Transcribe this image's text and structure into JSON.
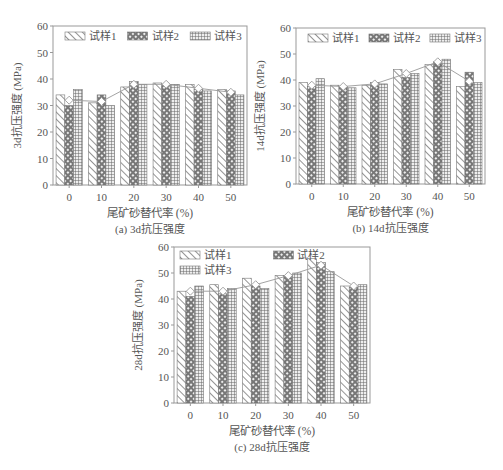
{
  "figure": {
    "x_axis_label": "尾矿砂替代率 (%)",
    "y_unit": "(MPa)",
    "legend": [
      "试样1",
      "试样2",
      "试样3"
    ]
  },
  "chart_data": [
    {
      "type": "bar",
      "id": "a",
      "title": "(a) 3d抗压强度",
      "xlabel": "尾矿砂替代率 (%)",
      "ylabel": "3d抗压强度 (MPa)",
      "categories": [
        "0",
        "10",
        "20",
        "30",
        "40",
        "50"
      ],
      "ylim": [
        0,
        60
      ],
      "yticks": [
        0,
        10,
        20,
        30,
        40,
        50,
        60
      ],
      "legend_position": "top-inside, single row",
      "series": [
        {
          "name": "试样1",
          "pattern": "diagonal-hatch",
          "values": [
            34,
            31,
            37,
            38.5,
            38,
            36
          ]
        },
        {
          "name": "试样2",
          "pattern": "crosshatch-diamond",
          "values": [
            30,
            34,
            39,
            38,
            36,
            35.5
          ]
        },
        {
          "name": "试样3",
          "pattern": "grid",
          "values": [
            36,
            30,
            38,
            38,
            35.5,
            34
          ]
        },
        {
          "name": "平均值",
          "type": "line",
          "marker": "diamond-open",
          "values": [
            32,
            31.5,
            38,
            38,
            36.5,
            35
          ]
        }
      ]
    },
    {
      "type": "bar",
      "id": "b",
      "title": "(b) 14d抗压强度",
      "xlabel": "尾矿砂替代率 (%)",
      "ylabel": "14d抗压强度 (MPa)",
      "categories": [
        "0",
        "10",
        "20",
        "30",
        "40",
        "50"
      ],
      "ylim": [
        0,
        60
      ],
      "yticks": [
        0,
        10,
        20,
        30,
        40,
        50,
        60
      ],
      "legend_position": "top-inside, single row",
      "series": [
        {
          "name": "试样1",
          "pattern": "diagonal-hatch",
          "values": [
            39,
            38,
            38,
            44,
            46,
            37.5
          ]
        },
        {
          "name": "试样2",
          "pattern": "crosshatch-diamond",
          "values": [
            37.5,
            37.5,
            39,
            41,
            47,
            43
          ]
        },
        {
          "name": "试样3",
          "pattern": "grid",
          "values": [
            40.5,
            37,
            38.5,
            42.5,
            48,
            39
          ]
        },
        {
          "name": "平均值",
          "type": "line",
          "marker": "diamond-open",
          "values": [
            38,
            37.5,
            38.5,
            42.5,
            47,
            39.5
          ]
        }
      ]
    },
    {
      "type": "bar",
      "id": "c",
      "title": "(c) 28d抗压强度",
      "xlabel": "尾矿砂替代率 (%)",
      "ylabel": "28d抗压强度 (MPa)",
      "categories": [
        "0",
        "10",
        "20",
        "30",
        "40",
        "50"
      ],
      "ylim": [
        0,
        60
      ],
      "yticks": [
        0,
        10,
        20,
        30,
        40,
        50,
        60
      ],
      "legend_position": "top-inside, two rows",
      "series": [
        {
          "name": "试样1",
          "pattern": "diagonal-hatch",
          "values": [
            43,
            45.5,
            48,
            49,
            55.5,
            45
          ]
        },
        {
          "name": "试样2",
          "pattern": "crosshatch-diamond",
          "values": [
            41,
            42,
            45,
            49,
            54,
            44.5
          ]
        },
        {
          "name": "试样3",
          "pattern": "grid",
          "values": [
            45,
            44,
            44,
            50,
            50.5,
            45.5
          ]
        },
        {
          "name": "平均值",
          "type": "line",
          "marker": "diamond-open",
          "values": [
            43,
            43,
            45.5,
            49,
            53,
            45
          ]
        }
      ]
    }
  ]
}
